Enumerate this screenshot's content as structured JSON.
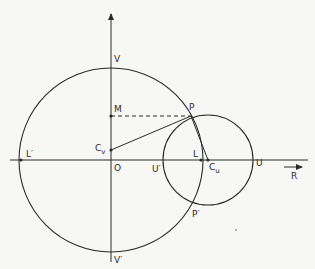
{
  "diagram": {
    "labels": {
      "V": "V",
      "V_prime": "V′",
      "M": "M",
      "P": "P",
      "P_prime": "P′",
      "Cv": "C",
      "Cv_sub": "v",
      "O": "O",
      "L": "L",
      "L_prime": "L′",
      "U": "U",
      "U_prime": "U′",
      "Cu": "C",
      "Cu_sub": "u",
      "R": "R"
    },
    "colors": {
      "stroke": "#2a2a2a",
      "background": "#f7f7f5"
    },
    "geometry": {
      "origin": [
        111,
        160
      ],
      "large_circle": {
        "center": [
          111,
          160
        ],
        "r": 92
      },
      "small_circle": {
        "center": [
          208,
          160
        ],
        "r": 45
      },
      "points": {
        "V": [
          111,
          67
        ],
        "V_prime": [
          111,
          253
        ],
        "M": [
          111,
          116
        ],
        "P": [
          191,
          116
        ],
        "Cv": [
          111,
          150
        ],
        "L": [
          201,
          160
        ],
        "L_prime": [
          21,
          160
        ],
        "Cu": [
          208,
          160
        ],
        "U": [
          253,
          160
        ],
        "U_prime": [
          164,
          160
        ],
        "P_prime": [
          191,
          204
        ]
      }
    }
  }
}
